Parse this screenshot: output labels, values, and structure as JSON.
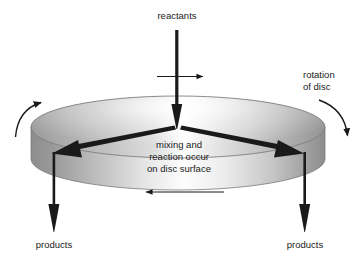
{
  "figure": {
    "background_color": "#ffffff",
    "ink_color": "#1a1a1a",
    "labels": {
      "reactants": "reactants",
      "rotation_line1": "rotation",
      "rotation_line2": "of disc",
      "center_line1": "mixing and",
      "center_line2": "reaction occur",
      "center_line3": "on disc surface",
      "products_left": "products",
      "products_right": "products"
    },
    "disc": {
      "top_surface_light": "#ffffff",
      "top_surface_mid": "#b8b8b8",
      "top_surface_dark": "#8a8a8a",
      "side_light": "#fbfbfb",
      "side_dark": "#8f8f8f",
      "outline_color": "#6f6f6f"
    },
    "arrows": {
      "reactants_feed": "down-arrow-thick",
      "spread_left": "diagonal-arrow-left",
      "spread_right": "diagonal-arrow-right",
      "product_left": "down-arrow-thick",
      "product_right": "down-arrow-thick",
      "top_cross": "right-arrow-thin",
      "side_flow": "left-arrow-thin",
      "rotation_left": "curved-arrow-up-right",
      "rotation_right": "curved-arrow-down"
    }
  }
}
